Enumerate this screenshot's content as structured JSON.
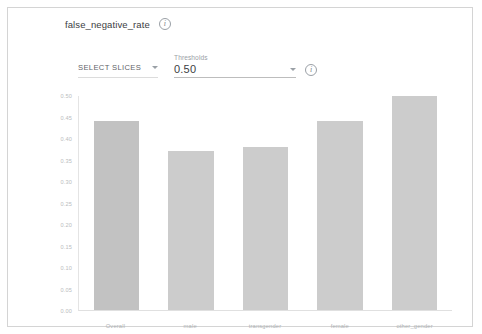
{
  "card": {
    "metric_title": "false_negative_rate",
    "info_icon": "info-icon",
    "info_glyph": "i"
  },
  "controls": {
    "select_slices_label": "SELECT SLICES",
    "select_slices_caret": "chevron-down-icon",
    "thresholds_label": "Thresholds",
    "thresholds_value": "0.50",
    "thresholds_caret": "chevron-down-icon",
    "thresholds_info_glyph": "i"
  },
  "chart_data": {
    "type": "bar",
    "title": "false_negative_rate",
    "categories": [
      "Overall",
      "male",
      "transgender",
      "female",
      "other_gender"
    ],
    "values": [
      0.44,
      0.37,
      0.38,
      0.44,
      0.5
    ],
    "xlabel": "",
    "ylabel": "",
    "ylim": [
      0.0,
      0.5
    ],
    "yticks": [
      "0.50",
      "0.45",
      "0.40",
      "0.35",
      "0.30",
      "0.25",
      "0.20",
      "0.15",
      "0.10",
      "0.05",
      "0.00"
    ],
    "ytick_values": [
      0.5,
      0.45,
      0.4,
      0.35,
      0.3,
      0.25,
      0.2,
      0.15,
      0.1,
      0.05,
      0.0
    ],
    "grid": false,
    "legend": "none",
    "bar_color": "#cccccc",
    "bar_color_highlight": "#c2c2c2"
  }
}
